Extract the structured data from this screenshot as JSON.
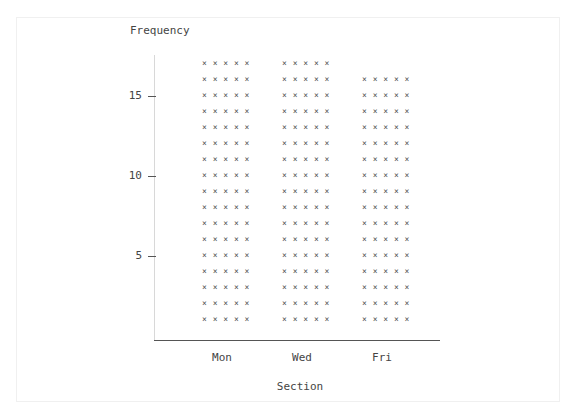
{
  "chart_data": {
    "type": "bar",
    "style": "ascii-star-histogram",
    "title": "",
    "xlabel": "Section",
    "ylabel": "Frequency",
    "categories": [
      "Mon",
      "Wed",
      "Fri"
    ],
    "values": [
      17,
      17,
      16
    ],
    "yticks": [
      5,
      10,
      15
    ],
    "ylim": [
      0,
      17
    ],
    "bar_symbol": "*****",
    "grid": false,
    "legend": null
  },
  "labels": {
    "ylabel": "Frequency",
    "xlabel": "Section",
    "yticks": [
      "5",
      "10",
      "15"
    ],
    "xticks": [
      "Mon",
      "Wed",
      "Fri"
    ]
  }
}
